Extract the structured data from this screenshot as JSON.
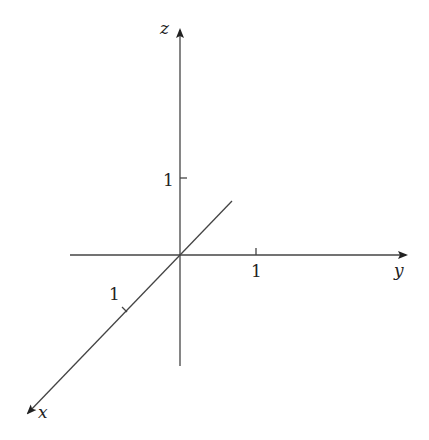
{
  "diagram": {
    "type": "3d-coordinate-axes",
    "axes": {
      "x": {
        "label": "x",
        "tick_label": "1"
      },
      "y": {
        "label": "y",
        "tick_label": "1"
      },
      "z": {
        "label": "z",
        "tick_label": "1"
      }
    },
    "colors": {
      "line": "#444444",
      "text": "#222222",
      "background": "#ffffff"
    }
  }
}
